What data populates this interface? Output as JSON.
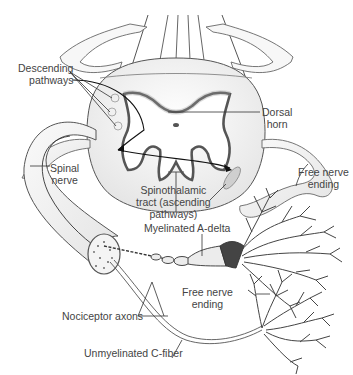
{
  "diagram": {
    "colors": {
      "stroke": "#333333",
      "fill_light": "#f2f2f2",
      "gray_matter": "#ffffff",
      "gray_shadow": "#777777",
      "text": "#444444"
    },
    "labels": {
      "descending": {
        "line1": "Descending",
        "line2": "pathways"
      },
      "dorsal_horn": {
        "line1": "Dorsal",
        "line2": "horn"
      },
      "spinal_nerve": {
        "line1": "Spinal",
        "line2": "nerve"
      },
      "spinothalamic": {
        "line1": "Spinothalamic",
        "line2": "tract (ascending",
        "line3": "pathways)"
      },
      "free_nerve_top": {
        "line1": "Free nerve",
        "line2": "ending"
      },
      "myelinated": {
        "text": "Myelinated A-delta"
      },
      "free_nerve_bottom": {
        "line1": "Free nerve",
        "line2": "ending"
      },
      "nociceptor": {
        "text": "Nociceptor axons"
      },
      "unmyelinated": {
        "text": "Unmyelinated C-fiber"
      }
    }
  }
}
